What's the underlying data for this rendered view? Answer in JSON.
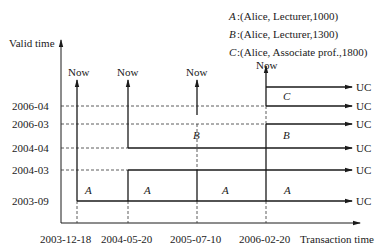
{
  "legend": [
    {
      "key": "A",
      "text": ":(Alice, Lecturer,1000)"
    },
    {
      "key": "B",
      "text": ":(Alice, Lecturer,1300)"
    },
    {
      "key": "C",
      "text": ":(Alice, Associate prof.,1800)"
    }
  ],
  "axes": {
    "y_label": "Valid time",
    "x_label": "Transaction time"
  },
  "x_ticks": [
    "2003-12-18",
    "2004-05-20",
    "2005-07-10",
    "2006-02-20"
  ],
  "y_ticks": [
    "2006-04",
    "2006-03",
    "2004-04",
    "2004-03",
    "2003-09"
  ],
  "now_label": "Now",
  "uc_label": "UC",
  "regions": [
    {
      "label": "A",
      "tx": "2003-12-18"
    },
    {
      "label": "A",
      "tx": "2004-05-20"
    },
    {
      "label": "A",
      "tx": "2005-07-10"
    },
    {
      "label": "A",
      "tx": "2006-02-20"
    },
    {
      "label": "B",
      "tx": "2005-07-10"
    },
    {
      "label": "B",
      "tx": "2006-02-20"
    },
    {
      "label": "C",
      "tx": "2006-02-20"
    }
  ]
}
